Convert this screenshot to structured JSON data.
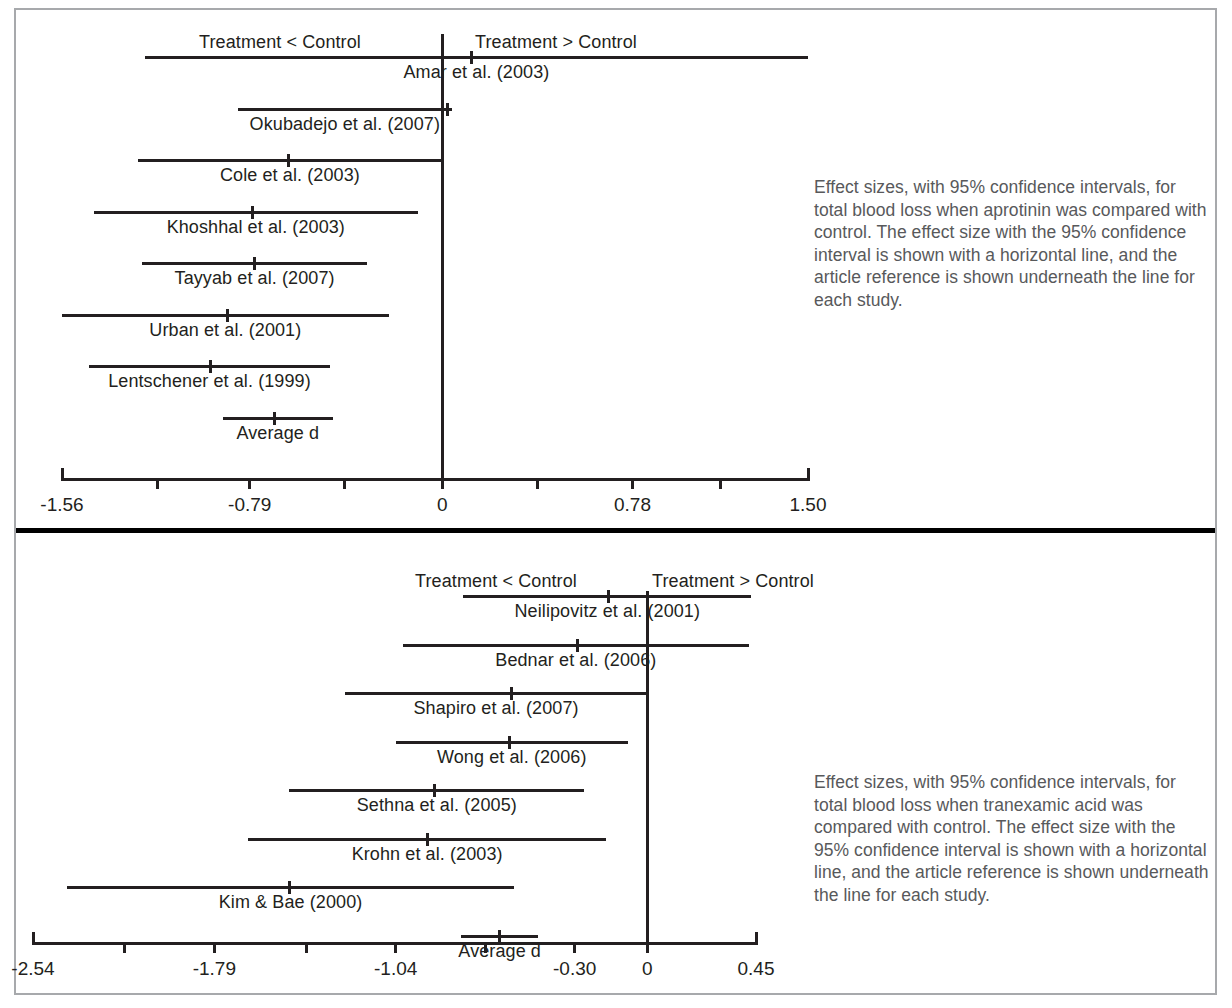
{
  "figure": {
    "direction_label_left": "Treatment < Control",
    "direction_label_right": "Treatment > Control",
    "average_label": "Average d"
  },
  "panels": [
    {
      "id": "aprotinin",
      "caption": "Effect sizes, with 95% confidence intervals, for total blood loss when aprotinin was compared with control. The effect size with the 95% confidence interval is shown with a horizontal line, and the article reference is shown underneath the line for each study.",
      "axis": {
        "tick_labels": [
          "-1.56",
          "-0.79",
          "0",
          "0.78",
          "1.50"
        ],
        "tick_values": [
          -1.56,
          -0.79,
          0,
          0.78,
          1.5
        ],
        "minor_tick_values": [
          -1.17,
          -0.4,
          0.39,
          1.14
        ],
        "min": -1.56,
        "max": 1.5
      },
      "rows": [
        {
          "label": "Amar et al. (2003)",
          "effect": 0.12,
          "ci_low": -1.22,
          "ci_high": 1.5
        },
        {
          "label": "Okubadejo et al. (2007)",
          "effect": 0.02,
          "ci_low": -0.84,
          "ci_high": 0.04
        },
        {
          "label": "Cole et al. (2003)",
          "effect": -0.63,
          "ci_low": -1.25,
          "ci_high": 0.0
        },
        {
          "label": "Khoshhal et al. (2003)",
          "effect": -0.78,
          "ci_low": -1.43,
          "ci_high": -0.1
        },
        {
          "label": "Tayyab et al. (2007)",
          "effect": -0.77,
          "ci_low": -1.23,
          "ci_high": -0.31
        },
        {
          "label": "Urban et al. (2001)",
          "effect": -0.88,
          "ci_low": -1.56,
          "ci_high": -0.22
        },
        {
          "label": "Lentschener et al. (1999)",
          "effect": -0.95,
          "ci_low": -1.45,
          "ci_high": -0.46
        },
        {
          "label": "Average d",
          "effect": -0.69,
          "ci_low": -0.9,
          "ci_high": -0.45
        }
      ]
    },
    {
      "id": "tranexamic-acid",
      "caption": "Effect sizes, with 95% confidence intervals, for total blood loss when tranexamic acid was compared with control. The effect size with the 95% confidence interval is shown with a horizontal line, and the article reference is shown underneath the line for each study.",
      "axis": {
        "tick_labels": [
          "-2.54",
          "-1.79",
          "-1.04",
          "-0.30",
          "0",
          "0.45"
        ],
        "tick_values": [
          -2.54,
          -1.79,
          -1.04,
          -0.3,
          0,
          0.45
        ],
        "minor_tick_values": [
          -2.16,
          -1.41,
          -0.67
        ],
        "min": -2.54,
        "max": 0.45
      },
      "rows": [
        {
          "label": "Neilipovitz et al. (2001)",
          "effect": -0.16,
          "ci_low": -0.76,
          "ci_high": 0.43
        },
        {
          "label": "Bednar et al. (2006)",
          "effect": -0.29,
          "ci_low": -1.01,
          "ci_high": 0.42
        },
        {
          "label": "Shapiro et al. (2007)",
          "effect": -0.56,
          "ci_low": -1.25,
          "ci_high": 0.0
        },
        {
          "label": "Wong et al. (2006)",
          "effect": -0.57,
          "ci_low": -1.04,
          "ci_high": -0.08
        },
        {
          "label": "Sethna et al. (2005)",
          "effect": -0.88,
          "ci_low": -1.48,
          "ci_high": -0.26
        },
        {
          "label": "Krohn et al. (2003)",
          "effect": -0.91,
          "ci_low": -1.65,
          "ci_high": -0.17
        },
        {
          "label": "Kim & Bae (2000)",
          "effect": -1.48,
          "ci_low": -2.4,
          "ci_high": -0.55
        },
        {
          "label": "Average d",
          "effect": -0.61,
          "ci_low": -0.77,
          "ci_high": -0.45
        }
      ]
    }
  ],
  "chart_data": {
    "type": "forest",
    "title": "",
    "panels": [
      {
        "name": "Aprotinin vs control — total blood loss",
        "xlabel": "",
        "ylabel": "",
        "xlim": [
          -1.56,
          1.5
        ],
        "xticks": [
          -1.56,
          -0.79,
          0,
          0.78,
          1.5
        ],
        "xticklabels": [
          "-1.56",
          "-0.79",
          "0",
          "0.78",
          "1.50"
        ],
        "grid": false,
        "reference_line": 0,
        "annotations": [
          "Treatment < Control",
          "Treatment > Control"
        ],
        "studies": [
          "Amar et al. (2003)",
          "Okubadejo et al. (2007)",
          "Cole et al. (2003)",
          "Khoshhal et al. (2003)",
          "Tayyab et al. (2007)",
          "Urban et al. (2001)",
          "Lentschener et al. (1999)",
          "Average d"
        ],
        "effect_sizes": [
          0.12,
          0.02,
          -0.63,
          -0.78,
          -0.77,
          -0.88,
          -0.95,
          -0.69
        ],
        "ci_low": [
          -1.22,
          -0.84,
          -1.25,
          -1.43,
          -1.23,
          -1.56,
          -1.45,
          -0.9
        ],
        "ci_high": [
          1.5,
          0.04,
          0.0,
          -0.1,
          -0.31,
          -0.22,
          -0.46,
          -0.45
        ]
      },
      {
        "name": "Tranexamic acid vs control — total blood loss",
        "xlabel": "",
        "ylabel": "",
        "xlim": [
          -2.54,
          0.45
        ],
        "xticks": [
          -2.54,
          -1.79,
          -1.04,
          -0.3,
          0,
          0.45
        ],
        "xticklabels": [
          "-2.54",
          "-1.79",
          "-1.04",
          "-0.30",
          "0",
          "0.45"
        ],
        "grid": false,
        "reference_line": 0,
        "annotations": [
          "Treatment < Control",
          "Treatment > Control"
        ],
        "studies": [
          "Neilipovitz et al. (2001)",
          "Bednar et al. (2006)",
          "Shapiro et al. (2007)",
          "Wong et al. (2006)",
          "Sethna et al. (2005)",
          "Krohn et al. (2003)",
          "Kim & Bae (2000)",
          "Average d"
        ],
        "effect_sizes": [
          -0.16,
          -0.29,
          -0.56,
          -0.57,
          -0.88,
          -0.91,
          -1.48,
          -0.61
        ],
        "ci_low": [
          -0.76,
          -1.01,
          -1.25,
          -1.04,
          -1.48,
          -1.65,
          -2.4,
          -0.77
        ],
        "ci_high": [
          0.43,
          0.42,
          0.0,
          -0.08,
          -0.26,
          -0.17,
          -0.55,
          -0.45
        ]
      }
    ]
  }
}
